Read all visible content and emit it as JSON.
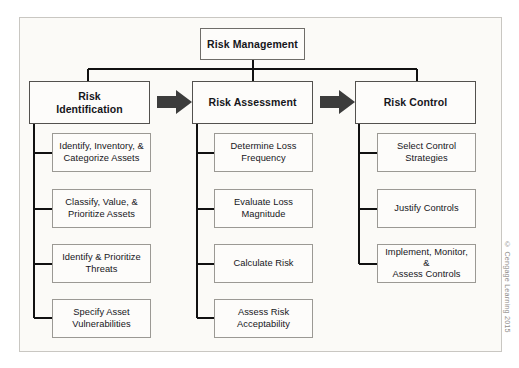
{
  "figure": {
    "title": "Risk Management",
    "credit": "© Cengage Learning 2015",
    "colors": {
      "page_background": "#ffffff",
      "frame_background": "#fbfaf7",
      "frame_border": "#c9c7c2",
      "box_border_dark": "#53514e",
      "box_border_light": "#9b9994",
      "box_fill": "#fdfcfa",
      "connector_line": "#111111",
      "arrow_fill": "#3c3c3c",
      "text": "#16161a",
      "credit_text": "#8f8d89"
    }
  },
  "root": {
    "label": "Risk Management"
  },
  "arrows": [
    {
      "name": "arrow-identification-to-assessment",
      "direction": "right"
    },
    {
      "name": "arrow-assessment-to-control",
      "direction": "right"
    }
  ],
  "columns": [
    {
      "id": "risk-identification",
      "header": "Risk\nIdentification",
      "header_line1": "Risk",
      "header_line2": "Identification",
      "steps": [
        {
          "line1": "Identify, Inventory, &",
          "line2": "Categorize Assets"
        },
        {
          "line1": "Classify, Value, &",
          "line2": "Prioritize Assets"
        },
        {
          "line1": "Identify & Prioritize",
          "line2": "Threats"
        },
        {
          "line1": "Specify Asset",
          "line2": "Vulnerabilities"
        }
      ]
    },
    {
      "id": "risk-assessment",
      "header": "Risk Assessment",
      "header_line1": "Risk Assessment",
      "header_line2": "",
      "steps": [
        {
          "line1": "Determine Loss",
          "line2": "Frequency"
        },
        {
          "line1": "Evaluate Loss",
          "line2": "Magnitude"
        },
        {
          "line1": "Calculate Risk",
          "line2": ""
        },
        {
          "line1": "Assess Risk",
          "line2": "Acceptability"
        }
      ]
    },
    {
      "id": "risk-control",
      "header": "Risk Control",
      "header_line1": "Risk Control",
      "header_line2": "",
      "steps": [
        {
          "line1": "Select Control",
          "line2": "Strategies"
        },
        {
          "line1": "Justify Controls",
          "line2": ""
        },
        {
          "line1": "Implement, Monitor, &",
          "line2": "Assess Controls"
        }
      ]
    }
  ]
}
